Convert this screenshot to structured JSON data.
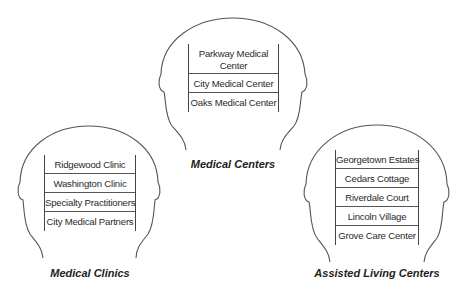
{
  "groups": [
    {
      "title": "Medical Centers",
      "items": [
        "Parkway Medical Center",
        "City Medical Center",
        "Oaks Medical Center"
      ]
    },
    {
      "title": "Medical Clinics",
      "items": [
        "Ridgewood Clinic",
        "Washington Clinic",
        "Specialty Practitioners",
        "City Medical Partners"
      ]
    },
    {
      "title": "Assisted Living Centers",
      "items": [
        "Georgetown Estates",
        "Cedars Cottage",
        "Riverdale Court",
        "Lincoln Village",
        "Grove Care Center"
      ]
    }
  ],
  "colors": {
    "stroke": "#555555",
    "text": "#222222",
    "background": "#ffffff"
  }
}
